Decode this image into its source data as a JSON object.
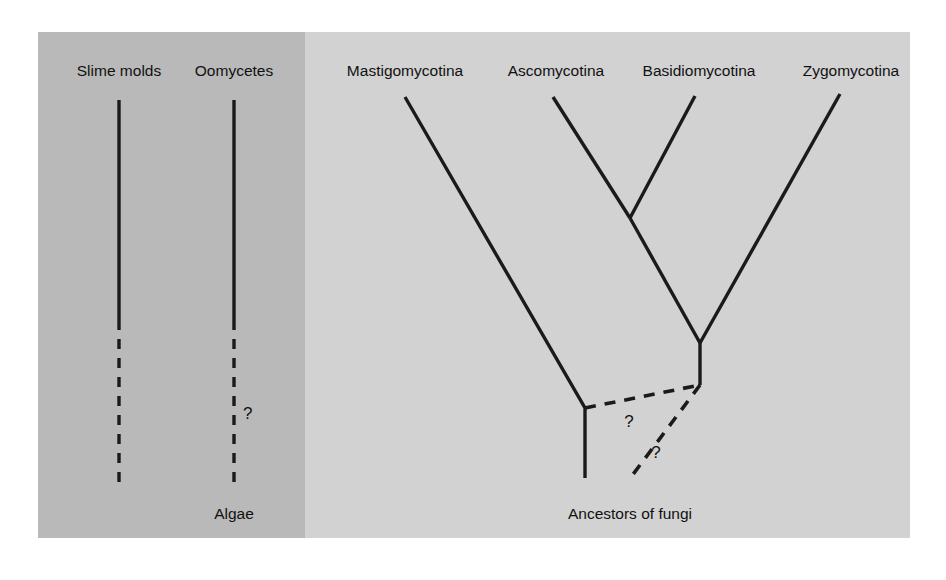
{
  "figure": {
    "panels": {
      "left": {
        "name": "non-fungal-panel",
        "background_color": "#b9b9b9",
        "bounds": {
          "x": 38,
          "y": 32,
          "width": 267,
          "height": 506
        },
        "labels": {
          "slime_molds": "Slime molds",
          "oomycetes": "Oomycetes",
          "algae": "Algae",
          "uncertainty_mark": "?"
        },
        "lineages": [
          {
            "name": "slime-molds-lineage",
            "label": "Slime molds",
            "x": 119,
            "solid_from_y": 100,
            "solid_to_y": 320,
            "dashed_from_y": 320,
            "dashed_to_y": 487,
            "has_question_mark": false
          },
          {
            "name": "oomycetes-lineage",
            "label": "Oomycetes",
            "x": 234,
            "solid_from_y": 100,
            "solid_to_y": 320,
            "dashed_from_y": 320,
            "dashed_to_y": 487,
            "has_question_mark": true,
            "question_mark_at": {
              "x": 243,
              "y": 412
            }
          }
        ],
        "root_label": {
          "text": "Algae",
          "x": 234,
          "y": 513
        }
      },
      "right": {
        "name": "fungi-panel",
        "background_color": "#d2d2d2",
        "bounds": {
          "x": 305,
          "y": 32,
          "width": 605,
          "height": 506
        },
        "labels": {
          "mastigomycotina": "Mastigomycotina",
          "ascomycotina": "Ascomycotina",
          "basidiomycotina": "Basidiomycotina",
          "zygomycotina": "Zygomycotina",
          "ancestors": "Ancestors of fungi",
          "uncertainty_mark": "?"
        },
        "tips": [
          {
            "name": "mastigomycotina-tip",
            "label": "Mastigomycotina",
            "label_x": 405,
            "label_y": 73,
            "tip_x": 405,
            "tip_y": 97
          },
          {
            "name": "ascomycotina-tip",
            "label": "Ascomycotina",
            "label_x": 556,
            "label_y": 73,
            "tip_x": 553,
            "tip_y": 97
          },
          {
            "name": "basidiomycotina-tip",
            "label": "Basidiomycotina",
            "label_x": 699,
            "label_y": 73,
            "tip_x": 695,
            "tip_y": 96
          },
          {
            "name": "zygomycotina-tip",
            "label": "Zygomycotina",
            "label_x": 851,
            "label_y": 73,
            "tip_x": 840,
            "tip_y": 94
          }
        ],
        "nodes": [
          {
            "name": "asco-basidio-node",
            "x": 630,
            "y": 218
          },
          {
            "name": "fungal-crown-node",
            "x": 700,
            "y": 343
          },
          {
            "name": "mastigo-base-node",
            "x": 585,
            "y": 408
          },
          {
            "name": "dashed-junction-node",
            "x": 700,
            "y": 385
          }
        ],
        "root_label": {
          "text": "Ancestors of fungi",
          "x": 630,
          "y": 513
        },
        "question_marks": [
          {
            "name": "question-mark-upper",
            "text": "?",
            "x": 629,
            "y": 421
          },
          {
            "name": "question-mark-lower",
            "text": "?",
            "x": 656,
            "y": 452
          }
        ]
      }
    },
    "colors": {
      "page_background": "#ffffff",
      "left_panel": "#b9b9b9",
      "right_panel": "#d2d2d2",
      "line": "#1a1a1a",
      "text": "#111111"
    }
  }
}
